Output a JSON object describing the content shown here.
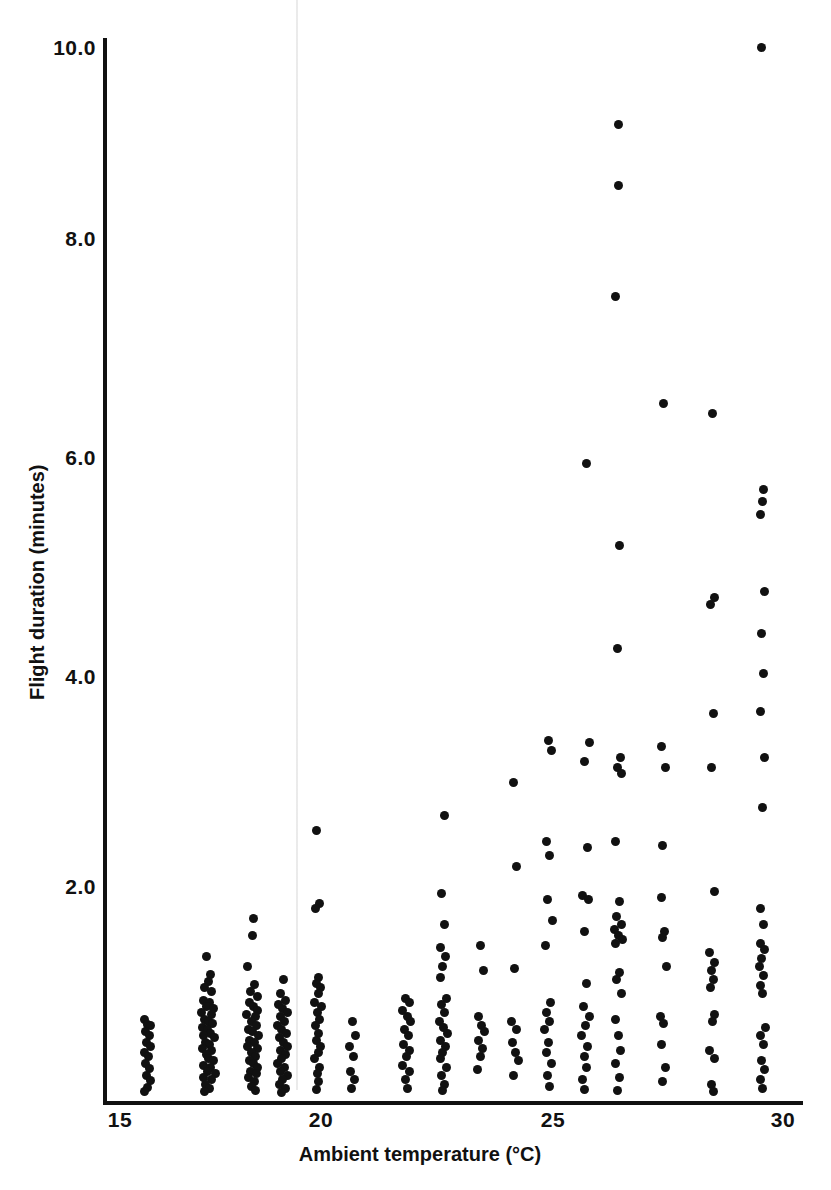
{
  "chart_data": {
    "type": "scatter",
    "title": "",
    "xlabel": "Ambient temperature (°C)",
    "ylabel": "Flight duration (minutes)",
    "xlim": [
      14.6,
      30.6
    ],
    "ylim": [
      0.0,
      10.4
    ],
    "xticks": [
      15,
      20,
      25,
      30
    ],
    "xtick_labels": [
      "15",
      "20",
      "25",
      "30"
    ],
    "yticks": [
      2.0,
      4.0,
      6.0,
      8.0,
      10.0
    ],
    "ytick_labels": [
      "2.0",
      "4.0",
      "6.0",
      "8.0",
      "10.0"
    ],
    "grid": false,
    "legend": null,
    "marker": "filled-circle",
    "marker_color": "#111111",
    "points": [
      [
        15.55,
        0.72
      ],
      [
        15.62,
        0.67
      ],
      [
        15.7,
        0.66
      ],
      [
        15.58,
        0.6
      ],
      [
        15.66,
        0.56
      ],
      [
        15.6,
        0.5
      ],
      [
        15.68,
        0.46
      ],
      [
        15.56,
        0.4
      ],
      [
        15.64,
        0.36
      ],
      [
        15.58,
        0.3
      ],
      [
        15.66,
        0.25
      ],
      [
        15.6,
        0.18
      ],
      [
        15.7,
        0.13
      ],
      [
        15.62,
        0.07
      ],
      [
        15.56,
        0.03
      ],
      [
        16.95,
        1.32
      ],
      [
        17.05,
        1.15
      ],
      [
        17.0,
        1.08
      ],
      [
        16.92,
        1.02
      ],
      [
        17.08,
        0.98
      ],
      [
        16.88,
        0.9
      ],
      [
        17.02,
        0.88
      ],
      [
        16.96,
        0.84
      ],
      [
        17.12,
        0.82
      ],
      [
        16.84,
        0.78
      ],
      [
        17.06,
        0.76
      ],
      [
        16.92,
        0.72
      ],
      [
        17.0,
        0.7
      ],
      [
        17.1,
        0.68
      ],
      [
        16.86,
        0.64
      ],
      [
        16.98,
        0.62
      ],
      [
        17.04,
        0.58
      ],
      [
        16.9,
        0.56
      ],
      [
        17.14,
        0.54
      ],
      [
        16.94,
        0.5
      ],
      [
        17.02,
        0.48
      ],
      [
        16.86,
        0.44
      ],
      [
        17.08,
        0.42
      ],
      [
        16.96,
        0.38
      ],
      [
        17.0,
        0.34
      ],
      [
        17.12,
        0.32
      ],
      [
        16.9,
        0.28
      ],
      [
        17.04,
        0.26
      ],
      [
        16.98,
        0.22
      ],
      [
        17.16,
        0.2
      ],
      [
        16.88,
        0.16
      ],
      [
        17.06,
        0.14
      ],
      [
        16.94,
        0.1
      ],
      [
        17.02,
        0.06
      ],
      [
        16.92,
        0.03
      ],
      [
        18.02,
        1.68
      ],
      [
        18.0,
        1.52
      ],
      [
        17.88,
        1.22
      ],
      [
        18.05,
        1.05
      ],
      [
        17.96,
        0.98
      ],
      [
        18.1,
        0.94
      ],
      [
        17.92,
        0.88
      ],
      [
        18.02,
        0.84
      ],
      [
        18.12,
        0.8
      ],
      [
        17.86,
        0.76
      ],
      [
        18.06,
        0.74
      ],
      [
        17.98,
        0.7
      ],
      [
        18.08,
        0.66
      ],
      [
        17.9,
        0.62
      ],
      [
        18.0,
        0.6
      ],
      [
        18.14,
        0.56
      ],
      [
        17.94,
        0.52
      ],
      [
        18.04,
        0.5
      ],
      [
        17.88,
        0.46
      ],
      [
        18.1,
        0.44
      ],
      [
        17.98,
        0.4
      ],
      [
        18.06,
        0.36
      ],
      [
        17.92,
        0.32
      ],
      [
        18.02,
        0.3
      ],
      [
        18.12,
        0.26
      ],
      [
        17.96,
        0.22
      ],
      [
        18.08,
        0.2
      ],
      [
        17.9,
        0.16
      ],
      [
        18.04,
        0.12
      ],
      [
        17.98,
        0.08
      ],
      [
        18.06,
        0.04
      ],
      [
        18.7,
        1.1
      ],
      [
        18.62,
        0.96
      ],
      [
        18.74,
        0.9
      ],
      [
        18.58,
        0.86
      ],
      [
        18.68,
        0.82
      ],
      [
        18.78,
        0.78
      ],
      [
        18.64,
        0.74
      ],
      [
        18.72,
        0.7
      ],
      [
        18.56,
        0.66
      ],
      [
        18.66,
        0.62
      ],
      [
        18.76,
        0.58
      ],
      [
        18.6,
        0.54
      ],
      [
        18.7,
        0.5
      ],
      [
        18.8,
        0.46
      ],
      [
        18.62,
        0.42
      ],
      [
        18.74,
        0.38
      ],
      [
        18.66,
        0.34
      ],
      [
        18.56,
        0.3
      ],
      [
        18.72,
        0.26
      ],
      [
        18.64,
        0.22
      ],
      [
        18.78,
        0.18
      ],
      [
        18.68,
        0.14
      ],
      [
        18.6,
        0.1
      ],
      [
        18.74,
        0.06
      ],
      [
        18.66,
        0.02
      ],
      [
        19.45,
        2.52
      ],
      [
        19.52,
        1.82
      ],
      [
        19.42,
        1.78
      ],
      [
        19.5,
        1.12
      ],
      [
        19.44,
        1.06
      ],
      [
        19.54,
        1.02
      ],
      [
        19.48,
        0.96
      ],
      [
        19.4,
        0.88
      ],
      [
        19.56,
        0.84
      ],
      [
        19.46,
        0.78
      ],
      [
        19.52,
        0.72
      ],
      [
        19.42,
        0.66
      ],
      [
        19.5,
        0.58
      ],
      [
        19.44,
        0.52
      ],
      [
        19.54,
        0.46
      ],
      [
        19.48,
        0.4
      ],
      [
        19.4,
        0.34
      ],
      [
        19.52,
        0.26
      ],
      [
        19.46,
        0.2
      ],
      [
        19.5,
        0.12
      ],
      [
        19.44,
        0.05
      ],
      [
        20.25,
        0.7
      ],
      [
        20.32,
        0.56
      ],
      [
        20.2,
        0.46
      ],
      [
        20.28,
        0.36
      ],
      [
        20.22,
        0.22
      ],
      [
        20.3,
        0.14
      ],
      [
        20.24,
        0.06
      ],
      [
        21.45,
        0.92
      ],
      [
        21.55,
        0.88
      ],
      [
        21.4,
        0.8
      ],
      [
        21.5,
        0.74
      ],
      [
        21.58,
        0.7
      ],
      [
        21.44,
        0.62
      ],
      [
        21.52,
        0.56
      ],
      [
        21.42,
        0.48
      ],
      [
        21.56,
        0.42
      ],
      [
        21.48,
        0.36
      ],
      [
        21.4,
        0.28
      ],
      [
        21.54,
        0.22
      ],
      [
        21.46,
        0.14
      ],
      [
        21.5,
        0.06
      ],
      [
        22.35,
        2.66
      ],
      [
        22.28,
        1.92
      ],
      [
        22.34,
        1.62
      ],
      [
        22.26,
        1.4
      ],
      [
        22.36,
        1.32
      ],
      [
        22.3,
        1.22
      ],
      [
        22.24,
        1.12
      ],
      [
        22.38,
        0.92
      ],
      [
        22.28,
        0.86
      ],
      [
        22.34,
        0.78
      ],
      [
        22.22,
        0.7
      ],
      [
        22.32,
        0.64
      ],
      [
        22.4,
        0.58
      ],
      [
        22.26,
        0.52
      ],
      [
        22.36,
        0.46
      ],
      [
        22.3,
        0.4
      ],
      [
        22.24,
        0.34
      ],
      [
        22.38,
        0.26
      ],
      [
        22.28,
        0.18
      ],
      [
        22.34,
        0.1
      ],
      [
        22.3,
        0.04
      ],
      [
        23.15,
        1.42
      ],
      [
        23.22,
        1.18
      ],
      [
        23.1,
        0.74
      ],
      [
        23.18,
        0.66
      ],
      [
        23.24,
        0.6
      ],
      [
        23.12,
        0.52
      ],
      [
        23.2,
        0.44
      ],
      [
        23.16,
        0.36
      ],
      [
        23.08,
        0.24
      ],
      [
        23.9,
        2.98
      ],
      [
        23.98,
        2.18
      ],
      [
        23.92,
        1.2
      ],
      [
        23.86,
        0.7
      ],
      [
        23.96,
        0.62
      ],
      [
        23.88,
        0.5
      ],
      [
        23.94,
        0.4
      ],
      [
        24.02,
        0.32
      ],
      [
        23.9,
        0.18
      ],
      [
        24.7,
        3.38
      ],
      [
        24.76,
        3.28
      ],
      [
        24.66,
        2.42
      ],
      [
        24.72,
        2.28
      ],
      [
        24.68,
        1.86
      ],
      [
        24.78,
        1.66
      ],
      [
        24.62,
        1.42
      ],
      [
        24.74,
        0.88
      ],
      [
        24.66,
        0.78
      ],
      [
        24.72,
        0.7
      ],
      [
        24.6,
        0.62
      ],
      [
        24.7,
        0.5
      ],
      [
        24.64,
        0.4
      ],
      [
        24.76,
        0.3
      ],
      [
        24.68,
        0.18
      ],
      [
        24.72,
        0.08
      ],
      [
        25.55,
        6.02
      ],
      [
        25.62,
        3.36
      ],
      [
        25.5,
        3.18
      ],
      [
        25.58,
        2.36
      ],
      [
        25.46,
        1.9
      ],
      [
        25.6,
        1.86
      ],
      [
        25.52,
        1.56
      ],
      [
        25.56,
        1.06
      ],
      [
        25.48,
        0.84
      ],
      [
        25.62,
        0.74
      ],
      [
        25.54,
        0.66
      ],
      [
        25.44,
        0.56
      ],
      [
        25.58,
        0.46
      ],
      [
        25.5,
        0.36
      ],
      [
        25.56,
        0.26
      ],
      [
        25.46,
        0.14
      ],
      [
        25.52,
        0.05
      ],
      [
        26.28,
        9.26
      ],
      [
        26.28,
        8.68
      ],
      [
        26.22,
        7.62
      ],
      [
        26.3,
        5.24
      ],
      [
        26.26,
        4.26
      ],
      [
        26.32,
        3.22
      ],
      [
        26.26,
        3.12
      ],
      [
        26.34,
        3.06
      ],
      [
        26.2,
        2.42
      ],
      [
        26.3,
        1.84
      ],
      [
        26.24,
        1.7
      ],
      [
        26.34,
        1.62
      ],
      [
        26.18,
        1.58
      ],
      [
        26.28,
        1.52
      ],
      [
        26.36,
        1.48
      ],
      [
        26.22,
        1.44
      ],
      [
        26.3,
        1.16
      ],
      [
        26.24,
        1.1
      ],
      [
        26.34,
        0.96
      ],
      [
        26.2,
        0.72
      ],
      [
        26.28,
        0.56
      ],
      [
        26.32,
        0.42
      ],
      [
        26.22,
        0.3
      ],
      [
        26.3,
        0.16
      ],
      [
        26.26,
        0.04
      ],
      [
        27.3,
        6.6
      ],
      [
        27.26,
        3.32
      ],
      [
        27.34,
        3.12
      ],
      [
        27.28,
        2.38
      ],
      [
        27.24,
        1.88
      ],
      [
        27.32,
        1.56
      ],
      [
        27.28,
        1.5
      ],
      [
        27.36,
        1.22
      ],
      [
        27.22,
        0.74
      ],
      [
        27.3,
        0.68
      ],
      [
        27.26,
        0.48
      ],
      [
        27.34,
        0.26
      ],
      [
        27.28,
        0.12
      ],
      [
        28.4,
        6.5
      ],
      [
        28.44,
        4.74
      ],
      [
        28.36,
        4.68
      ],
      [
        28.42,
        3.64
      ],
      [
        28.38,
        3.12
      ],
      [
        28.46,
        1.94
      ],
      [
        28.34,
        1.36
      ],
      [
        28.44,
        1.26
      ],
      [
        28.38,
        1.18
      ],
      [
        28.42,
        1.1
      ],
      [
        28.36,
        1.02
      ],
      [
        28.46,
        0.76
      ],
      [
        28.4,
        0.7
      ],
      [
        28.34,
        0.42
      ],
      [
        28.44,
        0.34
      ],
      [
        28.38,
        0.1
      ],
      [
        28.42,
        0.03
      ],
      [
        29.52,
        10.0
      ],
      [
        29.56,
        5.78
      ],
      [
        29.54,
        5.66
      ],
      [
        29.5,
        5.54
      ],
      [
        29.58,
        4.8
      ],
      [
        29.52,
        4.4
      ],
      [
        29.56,
        4.02
      ],
      [
        29.5,
        3.66
      ],
      [
        29.58,
        3.22
      ],
      [
        29.54,
        2.74
      ],
      [
        29.48,
        1.78
      ],
      [
        29.56,
        1.62
      ],
      [
        29.5,
        1.44
      ],
      [
        29.58,
        1.38
      ],
      [
        29.52,
        1.3
      ],
      [
        29.46,
        1.22
      ],
      [
        29.56,
        1.14
      ],
      [
        29.5,
        1.04
      ],
      [
        29.54,
        0.96
      ],
      [
        29.6,
        0.64
      ],
      [
        29.5,
        0.56
      ],
      [
        29.56,
        0.48
      ],
      [
        29.52,
        0.32
      ],
      [
        29.58,
        0.24
      ],
      [
        29.5,
        0.14
      ],
      [
        29.54,
        0.06
      ]
    ]
  },
  "axis": {
    "x_title": "Ambient temperature (°C)",
    "y_title": "Flight duration (minutes)",
    "x_tick_labels": [
      "15",
      "20",
      "25",
      "30"
    ],
    "y_tick_labels": [
      "2.0",
      "4.0",
      "6.0",
      "8.0",
      "10.0"
    ],
    "line_color": "#111111"
  }
}
